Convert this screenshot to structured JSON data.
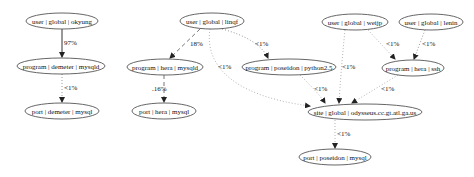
{
  "diagram": {
    "type": "directed-graph",
    "nodes": [
      {
        "id": "okyung",
        "label": "user | global | okyung",
        "cx": 62,
        "cy": 21,
        "rx": 36,
        "ry": 8
      },
      {
        "id": "linqf",
        "label": "user | global | linqf",
        "cx": 212,
        "cy": 21,
        "rx": 32,
        "ry": 8
      },
      {
        "id": "weijp",
        "label": "user | global | weijp",
        "cx": 355,
        "cy": 22,
        "rx": 33,
        "ry": 8
      },
      {
        "id": "lenin",
        "label": "user | global | lenin",
        "cx": 431,
        "cy": 22,
        "rx": 32,
        "ry": 8
      },
      {
        "id": "demeter_mysqld",
        "label": "program | demeter | mysqld",
        "cx": 61,
        "cy": 66,
        "rx": 44,
        "ry": 8
      },
      {
        "id": "hera_mysqld",
        "label": "program | hera | mysqld",
        "cx": 165,
        "cy": 67,
        "rx": 38,
        "ry": 8
      },
      {
        "id": "poseidon_python",
        "label": "program | poseidon | python2.5",
        "cx": 289,
        "cy": 67,
        "rx": 47,
        "ry": 8
      },
      {
        "id": "hera_ssh",
        "label": "program | hera | ssh",
        "cx": 413,
        "cy": 68,
        "rx": 31,
        "ry": 8
      },
      {
        "id": "demeter_port",
        "label": "port | demeter | mysql",
        "cx": 62,
        "cy": 111,
        "rx": 37,
        "ry": 8
      },
      {
        "id": "hera_port",
        "label": "port | hera | mysql",
        "cx": 164,
        "cy": 111,
        "rx": 32,
        "ry": 8
      },
      {
        "id": "site",
        "label": "site | global | odysseus.cc.gt.atl.ga.us",
        "cx": 365,
        "cy": 112,
        "rx": 57,
        "ry": 8
      },
      {
        "id": "poseidon_port",
        "label": "port | poseidon | mysql",
        "cx": 335,
        "cy": 157,
        "rx": 36,
        "ry": 8
      }
    ],
    "edges": [
      {
        "from": "okyung",
        "to": "demeter_mysqld",
        "label": "97%",
        "style": "solid",
        "color": "#333333",
        "path": "M62,29 L62,57",
        "lx": 64,
        "ly": 45
      },
      {
        "from": "demeter_mysqld",
        "to": "demeter_port",
        "label": "<1%",
        "style": "dotted",
        "color": "#9a9a9a",
        "path": "M62,74 L62,102",
        "lx": 64,
        "ly": 90
      },
      {
        "from": "linqf",
        "to": "hera_mysqld",
        "label": "18%",
        "style": "dashed",
        "color": "#777777",
        "path": "M200,29 L170,58",
        "lx": 190,
        "ly": 46
      },
      {
        "from": "hera_mysqld",
        "to": "hera_port",
        "label": ".16%",
        "style": "dashed",
        "color": "#777777",
        "path": "M164,75 L164,102",
        "lx": 152,
        "ly": 91
      },
      {
        "from": "linqf",
        "to": "poseidon_python",
        "label": "<1%",
        "style": "dotted",
        "color": "#9a9a9a",
        "path": "M222,29 C245,35 262,45 268,58",
        "lx": 255,
        "ly": 46
      },
      {
        "from": "linqf",
        "to": "site",
        "label": "<1%",
        "style": "dotted",
        "color": "#b5b5b5",
        "path": "M210,29 C205,60 225,95 310,106",
        "lx": 218,
        "ly": 69
      },
      {
        "from": "poseidon_python",
        "to": "site",
        "label": "<1%",
        "style": "dotted",
        "color": "#b5b5b5",
        "path": "M300,75 C310,85 320,95 325,103",
        "lx": 314,
        "ly": 91
      },
      {
        "from": "weijp",
        "to": "site",
        "label": "<1%",
        "style": "dotted",
        "color": "#b5b5b5",
        "path": "M345,30 C342,60 340,85 339,103",
        "lx": 342,
        "ly": 69
      },
      {
        "from": "weijp",
        "to": "hera_ssh",
        "label": "<1%",
        "style": "dotted",
        "color": "#b5b5b5",
        "path": "M368,30 L395,59",
        "lx": 386,
        "ly": 46
      },
      {
        "from": "lenin",
        "to": "hera_ssh",
        "label": "<1%",
        "style": "dotted",
        "color": "#9a9a9a",
        "path": "M425,30 L414,59",
        "lx": 422,
        "ly": 46
      },
      {
        "from": "hera_ssh",
        "to": "site",
        "label": "<1%",
        "style": "dotted",
        "color": "#b5b5b5",
        "path": "M398,75 L352,103",
        "lx": 381,
        "ly": 91
      },
      {
        "from": "site",
        "to": "poseidon_port",
        "label": "<1%",
        "style": "dotted",
        "color": "#b5b5b5",
        "path": "M335,120 L335,148",
        "lx": 337,
        "ly": 136
      }
    ],
    "colors": {
      "node_stroke": "#555555",
      "text": "#111111",
      "background": "#ffffff"
    }
  }
}
